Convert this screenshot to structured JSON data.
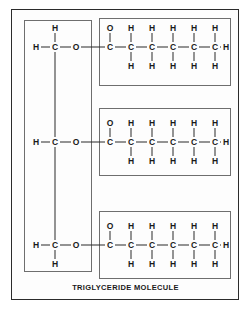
{
  "figure": {
    "caption": "TRIGLYCERIDE MOLECULE",
    "colors": {
      "outer_frame": "#2b2b2b",
      "inner_box": "#6e6e6e",
      "bond": "#2b2b2b",
      "atom_label": "#1a1a1a",
      "background": "#ffffff"
    }
  },
  "glycerol": {
    "name": "glycerol-backbone",
    "carbons": [
      {
        "id": "glycerol-carbon-1",
        "left_atom": "H",
        "center_atom": "C",
        "right_atom": "O",
        "top_atom": "H",
        "bottom_atom": ""
      },
      {
        "id": "glycerol-carbon-2",
        "left_atom": "H",
        "center_atom": "C",
        "right_atom": "O",
        "top_atom": "",
        "bottom_atom": ""
      },
      {
        "id": "glycerol-carbon-3",
        "left_atom": "H",
        "center_atom": "C",
        "right_atom": "O",
        "top_atom": "",
        "bottom_atom": "H"
      }
    ]
  },
  "fatty_acid_chains": [
    {
      "id": "fatty-acid-chain-1",
      "carbonyl_oxygen": "O",
      "terminal_hydrogen": "H",
      "carbons": [
        {
          "label": "C",
          "top": "O",
          "bottom": ""
        },
        {
          "label": "C",
          "top": "H",
          "bottom": "H"
        },
        {
          "label": "C",
          "top": "H",
          "bottom": "H"
        },
        {
          "label": "C",
          "top": "H",
          "bottom": "H"
        },
        {
          "label": "C",
          "top": "H",
          "bottom": "H"
        },
        {
          "label": "C",
          "top": "H",
          "bottom": "H"
        }
      ]
    },
    {
      "id": "fatty-acid-chain-2",
      "carbonyl_oxygen": "O",
      "terminal_hydrogen": "H",
      "carbons": [
        {
          "label": "C",
          "top": "O",
          "bottom": ""
        },
        {
          "label": "C",
          "top": "H",
          "bottom": "H"
        },
        {
          "label": "C",
          "top": "H",
          "bottom": "H"
        },
        {
          "label": "C",
          "top": "H",
          "bottom": "H"
        },
        {
          "label": "C",
          "top": "H",
          "bottom": "H"
        },
        {
          "label": "C",
          "top": "H",
          "bottom": "H"
        }
      ]
    },
    {
      "id": "fatty-acid-chain-3",
      "carbonyl_oxygen": "O",
      "terminal_hydrogen": "H",
      "carbons": [
        {
          "label": "C",
          "top": "O",
          "bottom": ""
        },
        {
          "label": "C",
          "top": "H",
          "bottom": "H"
        },
        {
          "label": "C",
          "top": "H",
          "bottom": "H"
        },
        {
          "label": "C",
          "top": "H",
          "bottom": "H"
        },
        {
          "label": "C",
          "top": "H",
          "bottom": "H"
        },
        {
          "label": "C",
          "top": "H",
          "bottom": "H"
        }
      ]
    }
  ],
  "layout": {
    "row_y": [
      47,
      142,
      245
    ],
    "glycerol_x": {
      "left_h": 36,
      "carbon": 55,
      "oxygen": 76
    },
    "chain_start_x": 110,
    "chain_step_x": 21,
    "chain_terminal_h_x": 226
  }
}
